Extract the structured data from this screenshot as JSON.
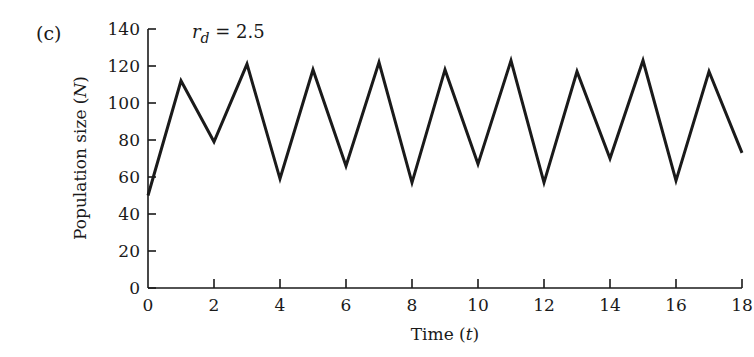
{
  "panel_label": "(c)",
  "chart_data": {
    "type": "line",
    "title": "",
    "annotation": {
      "symbol": "r",
      "subscript": "d",
      "text": "= 2.5"
    },
    "xlabel": "Time (t)",
    "xlabel_parts": {
      "text": "Time (",
      "var": "t",
      "close": ")"
    },
    "ylabel": "Population size (N)",
    "ylabel_parts": {
      "text": "Population size (",
      "var": "N",
      "close": ")"
    },
    "xlim": [
      0,
      18
    ],
    "ylim": [
      0,
      140
    ],
    "xticks": [
      0,
      2,
      4,
      6,
      8,
      10,
      12,
      14,
      16,
      18
    ],
    "yticks": [
      0,
      20,
      40,
      60,
      80,
      100,
      120,
      140
    ],
    "grid": false,
    "series": [
      {
        "name": "N",
        "color": "#1a1a1a",
        "x": [
          0,
          1,
          2,
          3,
          4,
          5,
          6,
          7,
          8,
          9,
          10,
          11,
          12,
          13,
          14,
          15,
          16,
          17,
          18
        ],
        "values": [
          50,
          112,
          79,
          121,
          59,
          118,
          66,
          122,
          57,
          118,
          67,
          123,
          57,
          117,
          70,
          123,
          58,
          117,
          73
        ]
      }
    ]
  }
}
